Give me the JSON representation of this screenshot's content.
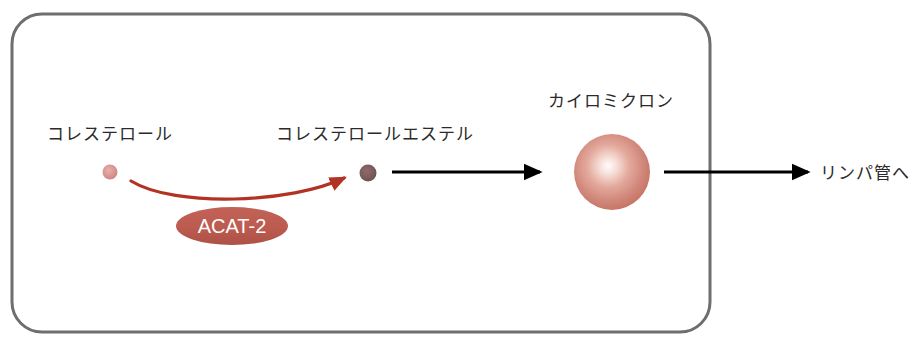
{
  "diagram": {
    "background_color": "#ffffff",
    "cell": {
      "name": "enterocyte-cell-membrane",
      "border_color": "#6e6e6e",
      "fill_color": "#ffffff",
      "border_width": 3,
      "corner_radius": 30,
      "x": 12,
      "y": 14,
      "width": 698,
      "height": 318
    },
    "labels": {
      "cholesterol": "コレステロール",
      "cholesterol_ester": "コレステロールエステル",
      "chylomicron": "カイロミクロン",
      "to_lymph_vessel": "リンパ管へ",
      "enzyme": "ACAT-2"
    },
    "particles": [
      {
        "name": "cholesterol-particle",
        "label": "コレステロール",
        "cx": 110,
        "cy": 172,
        "r": 7.5,
        "color": "#d99490",
        "edge_color": "#c07f7c"
      },
      {
        "name": "cholesterol-ester-particle",
        "label": "コレステロールエステル",
        "cx": 368,
        "cy": 173,
        "r": 8.5,
        "color": "#7d5a5c",
        "edge_color": "#6a4a4c"
      },
      {
        "name": "chylomicron-particle",
        "label": "カイロミクロン",
        "cx": 612,
        "cy": 172,
        "r": 38,
        "color": "#cb7a6e",
        "highlight_color": "#fdf6f3",
        "edge_color": "#c06a5e"
      }
    ],
    "enzyme": {
      "name": "acat-2-enzyme",
      "label": "ACAT-2",
      "fill_color": "#bc5b4f",
      "text_color": "#ffffff",
      "cx": 232,
      "cy": 226,
      "rx": 56,
      "ry": 19
    },
    "reaction_arrow": {
      "name": "esterification-reaction-arrow",
      "color": "#b33223",
      "width": 3,
      "from_x": 131,
      "from_y": 181,
      "to_x": 347,
      "to_y": 177
    },
    "transport_arrows": [
      {
        "name": "ester-to-chylomicron-arrow",
        "color": "#000000",
        "width": 3,
        "from_x": 392,
        "from_y": 172,
        "to_x": 540,
        "to_y": 172
      },
      {
        "name": "chylomicron-to-lymph-arrow",
        "color": "#000000",
        "width": 3,
        "from_x": 664,
        "from_y": 172,
        "to_x": 808,
        "to_y": 172
      }
    ]
  }
}
